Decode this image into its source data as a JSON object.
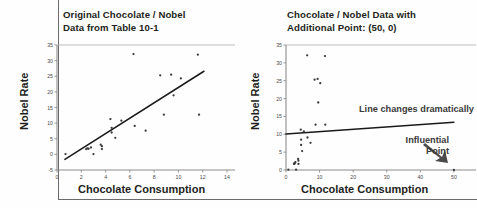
{
  "page": {
    "background_color": "#fefefe",
    "frame_color": "#6b6b6b"
  },
  "left_panel": {
    "title_line1": "Original Chocolate / Nobel",
    "title_line2": "Data from Table 10-1",
    "axis_title_x": "Chocolate Consumption",
    "axis_title_y": "Nobel Rate"
  },
  "right_panel": {
    "title_line1": "Chocolate / Nobel Data with",
    "title_line2": "Additional Point: (50, 0)",
    "axis_title_x": "Chocolate Consumption",
    "axis_title_y": "Nobel Rate",
    "annotation_line": "Line changes dramatically",
    "annotation_point_line1": "Influential",
    "annotation_point_line2": "Point"
  },
  "chart_data": [
    {
      "id": "original",
      "type": "scatter",
      "title": "Original Chocolate / Nobel Data from Table 10-1",
      "xlabel": "Chocolate Consumption",
      "ylabel": "Nobel Rate",
      "xlim": [
        0,
        14
      ],
      "ylim": [
        -5,
        35
      ],
      "xticks": [
        0,
        2,
        4,
        6,
        8,
        10,
        12,
        14
      ],
      "yticks": [
        -5,
        0,
        5,
        10,
        15,
        20,
        25,
        30,
        35
      ],
      "grid": false,
      "legend": "none",
      "marker_color": "#3d3d3d",
      "line_color": "#1a1a1a",
      "points": [
        {
          "x": 0.7,
          "y": 0.1
        },
        {
          "x": 2.4,
          "y": 1.7
        },
        {
          "x": 2.5,
          "y": 1.9
        },
        {
          "x": 2.6,
          "y": 1.8
        },
        {
          "x": 2.8,
          "y": 2.2
        },
        {
          "x": 3.0,
          "y": 0.1
        },
        {
          "x": 3.6,
          "y": 3.1
        },
        {
          "x": 3.7,
          "y": 2.6
        },
        {
          "x": 3.7,
          "y": 1.7
        },
        {
          "x": 4.4,
          "y": 11.3
        },
        {
          "x": 4.5,
          "y": 8.5
        },
        {
          "x": 4.5,
          "y": 7.0
        },
        {
          "x": 4.8,
          "y": 5.3
        },
        {
          "x": 5.3,
          "y": 10.8
        },
        {
          "x": 6.3,
          "y": 32.1
        },
        {
          "x": 6.4,
          "y": 9.1
        },
        {
          "x": 7.3,
          "y": 7.6
        },
        {
          "x": 8.5,
          "y": 25.3
        },
        {
          "x": 8.8,
          "y": 12.7
        },
        {
          "x": 9.4,
          "y": 25.5
        },
        {
          "x": 9.6,
          "y": 18.9
        },
        {
          "x": 10.2,
          "y": 24.3
        },
        {
          "x": 11.6,
          "y": 31.9
        },
        {
          "x": 11.7,
          "y": 12.7
        }
      ],
      "fit_line": {
        "x0": 0.65,
        "y0": -1.6,
        "x1": 12.1,
        "y1": 26.6
      }
    },
    {
      "id": "with-influential-point",
      "type": "scatter",
      "title": "Chocolate / Nobel Data with Additional Point: (50, 0)",
      "xlabel": "Chocolate Consumption",
      "ylabel": "Nobel Rate",
      "xlim": [
        0,
        53
      ],
      "ylim": [
        0,
        35
      ],
      "xticks": [
        0,
        10,
        20,
        30,
        40,
        50
      ],
      "yticks": [
        0,
        5,
        10,
        15,
        20,
        25,
        30,
        35
      ],
      "grid": false,
      "legend": "none",
      "marker_color": "#3d3d3d",
      "line_color": "#1a1a1a",
      "points": [
        {
          "x": 0.7,
          "y": 0.1
        },
        {
          "x": 2.4,
          "y": 1.7
        },
        {
          "x": 2.5,
          "y": 1.9
        },
        {
          "x": 2.6,
          "y": 1.8
        },
        {
          "x": 2.8,
          "y": 2.2
        },
        {
          "x": 3.0,
          "y": 0.1
        },
        {
          "x": 3.6,
          "y": 3.1
        },
        {
          "x": 3.7,
          "y": 2.6
        },
        {
          "x": 3.7,
          "y": 1.7
        },
        {
          "x": 4.4,
          "y": 11.3
        },
        {
          "x": 4.5,
          "y": 8.5
        },
        {
          "x": 4.5,
          "y": 7.0
        },
        {
          "x": 4.8,
          "y": 5.3
        },
        {
          "x": 5.3,
          "y": 10.8
        },
        {
          "x": 6.3,
          "y": 32.1
        },
        {
          "x": 6.4,
          "y": 9.1
        },
        {
          "x": 7.3,
          "y": 7.6
        },
        {
          "x": 8.5,
          "y": 25.3
        },
        {
          "x": 8.8,
          "y": 12.7
        },
        {
          "x": 9.4,
          "y": 25.5
        },
        {
          "x": 9.6,
          "y": 18.9
        },
        {
          "x": 10.2,
          "y": 24.3
        },
        {
          "x": 11.6,
          "y": 31.9
        },
        {
          "x": 11.7,
          "y": 12.7
        },
        {
          "x": 50.0,
          "y": 0.0
        }
      ],
      "influential_point": {
        "x": 50,
        "y": 0
      },
      "fit_line": {
        "x0": 0.0,
        "y0": 10.1,
        "x1": 50.0,
        "y1": 13.4
      }
    }
  ]
}
